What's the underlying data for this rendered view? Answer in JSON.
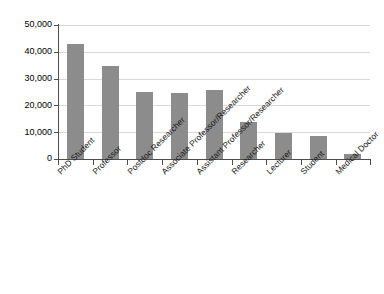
{
  "chart_data": {
    "type": "bar",
    "title": "",
    "xlabel": "",
    "ylabel": "",
    "ylim": [
      0,
      50000
    ],
    "grid": true,
    "legend": "none",
    "bar_color": "#8c8c8c",
    "categories": [
      "PhD Student",
      "Professor",
      "Postdoc Researcher",
      "Associate Professor/Researcher",
      "Assistant Professor/Researcher",
      "Researcher",
      "Lecturer",
      "Student",
      "Medical Doctor"
    ],
    "values": [
      43000,
      34800,
      25000,
      24800,
      25700,
      13800,
      9700,
      8600,
      1800
    ],
    "ytick_labels": [
      "50,000",
      "40,000",
      "30,000",
      "20,000",
      "10,000",
      "0"
    ],
    "ytick_values": [
      50000,
      40000,
      30000,
      20000,
      10000,
      0
    ]
  },
  "caption": ""
}
